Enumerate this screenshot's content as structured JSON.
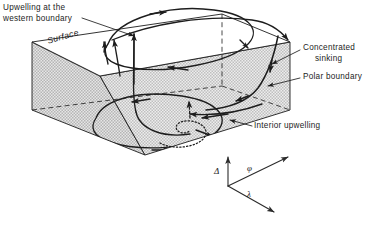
{
  "figure": {
    "background_color": "#ffffff",
    "line_color": "#1d1d1d",
    "face_fill_color": "#d8d8d8",
    "face_edge_color": "#1d1d1d"
  },
  "labels": {
    "upwelling_western_line1": "Upwelling at the",
    "upwelling_western_line2": "western boundary",
    "surface": "Surface",
    "concentrated_sinking_line1": "Concentrated",
    "concentrated_sinking_line2": "sinking",
    "polar_boundary": "Polar boundary",
    "interior_upwelling": "Interior upwelling"
  },
  "axes": {
    "vertical_label": "Δ",
    "depth_label": "φ",
    "longitude_label": "λ",
    "origin": [
      228,
      186
    ],
    "vertical_tip": [
      228,
      155
    ],
    "phi_tip": [
      290,
      156
    ],
    "lambda_tip": [
      275,
      214
    ]
  },
  "icons": {
    "leader_line": "leader-line-icon",
    "arrowhead": "arrowhead-icon",
    "axis_arrow": "axis-arrow-icon",
    "dotted_spiral": "dotted-spiral-icon"
  },
  "box_geometry": {
    "top_back_left": [
      32,
      42
    ],
    "top_back_right": [
      222,
      14
    ],
    "top_front_right": [
      290,
      42
    ],
    "top_front_left": [
      100,
      76
    ],
    "bottom_front_left": [
      32,
      110
    ],
    "bottom_front_mid": [
      145,
      155
    ],
    "bottom_front_right": [
      290,
      110
    ]
  },
  "flow_features": [
    {
      "name": "surface-gyre",
      "type": "closed-ellipse",
      "face": "top",
      "direction": "clockwise"
    },
    {
      "name": "interior-gyre",
      "type": "closed-ellipse",
      "face": "interior",
      "direction": "clockwise"
    },
    {
      "name": "western-boundary-upwelling",
      "type": "upward-arrows",
      "count": 3
    },
    {
      "name": "concentrated-sinking",
      "type": "descending-arrow",
      "face": "polar-right"
    },
    {
      "name": "interior-upwelling-spiral",
      "type": "dotted-spiral-with-arrow"
    }
  ]
}
